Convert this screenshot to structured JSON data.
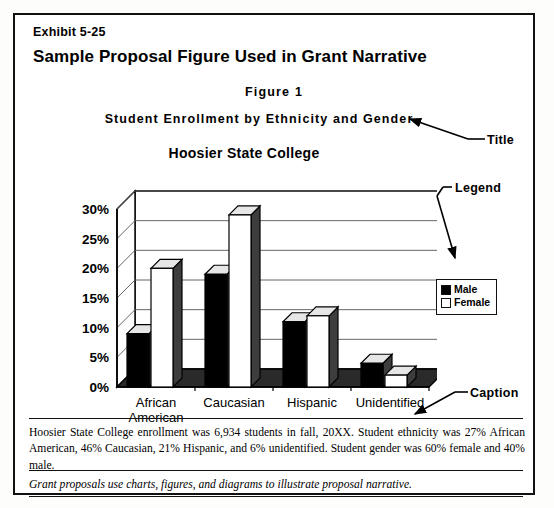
{
  "exhibit": {
    "label": "Exhibit 5-25",
    "title": "Sample Proposal Figure Used in Grant Narrative"
  },
  "figure": {
    "number": "Figure  1",
    "subtitle": "Student  Enrollment  by  Ethnicity  and  Gender",
    "chart_title": "Hoosier State College"
  },
  "legend": {
    "male_label": "Male",
    "female_label": "Female"
  },
  "annotations": {
    "title": "Title",
    "legend": "Legend",
    "caption": "Caption"
  },
  "caption": {
    "text": "Hoosier State College enrollment was 6,934 students in fall, 20XX.  Student ethnicity was 27% African American, 46% Caucasian, 21% Hispanic, and 6% unidentified.  Student gender was 60% female and 40% male.",
    "note": "Grant proposals use charts, figures, and diagrams to illustrate proposal narrative."
  },
  "colors": {
    "ink": "#000000",
    "paper": "#ffffff",
    "male_fill": "#000000",
    "female_fill": "#ffffff",
    "gridline": "#555555"
  },
  "chart_data": {
    "type": "bar",
    "title": "Hoosier State College",
    "subtitle": "Student  Enrollment  by  Ethnicity  and  Gender",
    "xlabel": "",
    "ylabel": "",
    "ylim": [
      0,
      30
    ],
    "ytick_values": [
      0,
      5,
      10,
      15,
      20,
      25,
      30
    ],
    "ytick_labels": [
      "0%",
      "5%",
      "10%",
      "15%",
      "20%",
      "25%",
      "30%"
    ],
    "grid": true,
    "legend_position": "right",
    "three_d": true,
    "categories": [
      "African American",
      "Caucasian",
      "Hispanic",
      "Unidentified"
    ],
    "category_lines": [
      [
        "African",
        "American"
      ],
      [
        "Caucasian"
      ],
      [
        "Hispanic"
      ],
      [
        "Unidentified"
      ]
    ],
    "series": [
      {
        "name": "Male",
        "values": [
          9,
          19,
          11,
          4
        ]
      },
      {
        "name": "Female",
        "values": [
          20,
          29,
          12,
          2
        ]
      }
    ]
  }
}
